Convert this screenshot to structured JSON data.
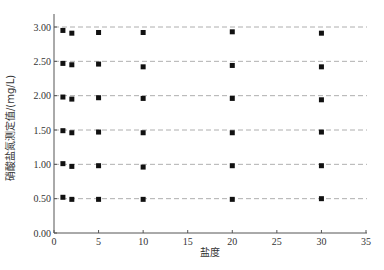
{
  "chart_data": {
    "type": "scatter",
    "title": "",
    "xlabel": "盐度",
    "ylabel": "硝酸盐氮测定值/(mg/L)",
    "xlim": [
      0,
      35
    ],
    "ylim": [
      0,
      3.0
    ],
    "xticks": [
      "0",
      "5",
      "10",
      "15",
      "20",
      "25",
      "30",
      "35"
    ],
    "xtick_values": [
      0,
      5,
      10,
      15,
      20,
      25,
      30,
      35
    ],
    "yticks": [
      "0.00",
      "0.50",
      "1.00",
      "1.50",
      "2.00",
      "2.50",
      "3.00"
    ],
    "ytick_values": [
      0,
      0.5,
      1.0,
      1.5,
      2.0,
      2.5,
      3.0
    ],
    "grid": "horizontal dashed reference lines at 0.50–3.00",
    "reference_lines": [
      0.5,
      1.0,
      1.5,
      2.0,
      2.5,
      3.0
    ],
    "x": [
      1,
      2,
      5,
      10,
      20,
      30
    ],
    "series": [
      {
        "name": "3.00",
        "values": [
          2.95,
          2.91,
          2.92,
          2.92,
          2.93,
          2.91
        ]
      },
      {
        "name": "2.50",
        "values": [
          2.47,
          2.45,
          2.46,
          2.42,
          2.44,
          2.42
        ]
      },
      {
        "name": "2.00",
        "values": [
          1.98,
          1.95,
          1.97,
          1.96,
          1.96,
          1.94
        ]
      },
      {
        "name": "1.50",
        "values": [
          1.49,
          1.46,
          1.47,
          1.46,
          1.46,
          1.47
        ]
      },
      {
        "name": "1.00",
        "values": [
          1.01,
          0.97,
          0.98,
          0.96,
          0.98,
          0.98
        ]
      },
      {
        "name": "0.50",
        "values": [
          0.52,
          0.49,
          0.49,
          0.49,
          0.49,
          0.5
        ]
      }
    ],
    "legend": "none",
    "marker_color": "#111111"
  }
}
